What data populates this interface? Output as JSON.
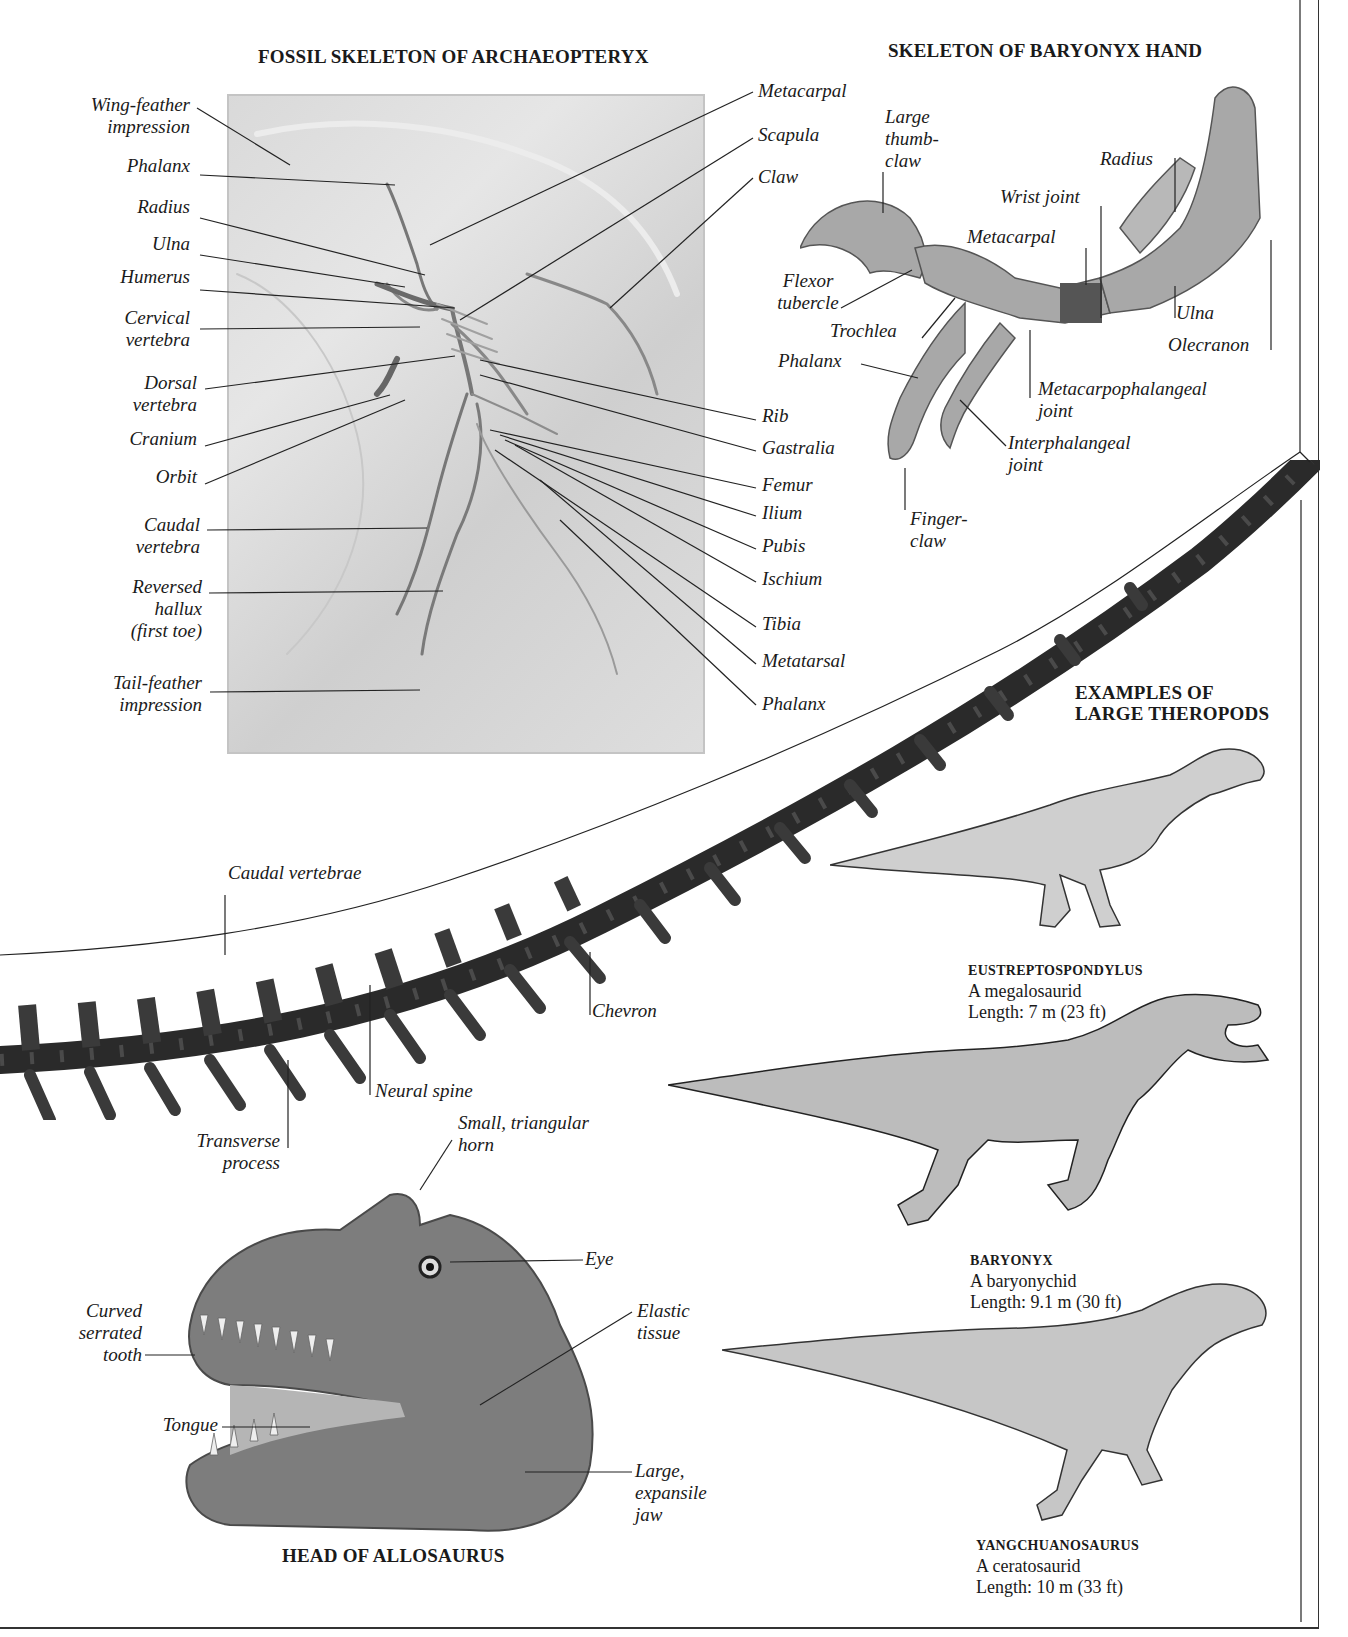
{
  "sections": {
    "archaeopteryx": {
      "title": "FOSSIL SKELETON OF ARCHAEOPTERYX",
      "labels_left": [
        "Wing-feather\nimpression",
        "Phalanx",
        "Radius",
        "Ulna",
        "Humerus",
        "Cervical\nvertebra",
        "Dorsal\nvertebra",
        "Cranium",
        "Orbit",
        "Caudal\nvertebra",
        "Reversed\nhallux\n(first toe)",
        "Tail-feather\nimpression"
      ],
      "labels_right": [
        "Metacarpal",
        "Scapula",
        "Claw",
        "Rib",
        "Gastralia",
        "Femur",
        "Ilium",
        "Pubis",
        "Ischium",
        "Tibia",
        "Metatarsal",
        "Phalanx"
      ]
    },
    "baryonyx_hand": {
      "title": "SKELETON OF BARYONYX HAND",
      "labels": {
        "large_thumb_claw": "Large\nthumb-\nclaw",
        "radius": "Radius",
        "wrist_joint": "Wrist joint",
        "metacarpal": "Metacarpal",
        "flexor_tubercle": "Flexor\ntubercle",
        "trochlea": "Trochlea",
        "ulna": "Ulna",
        "olecranon": "Olecranon",
        "phalanx": "Phalanx",
        "metacarpophalangeal_joint": "Metacarpophalangeal\njoint",
        "interphalangeal_joint": "Interphalangeal\njoint",
        "finger_claw": "Finger-\nclaw"
      }
    },
    "tail": {
      "labels": {
        "caudal_vertebrae": "Caudal vertebrae",
        "chevron": "Chevron",
        "neural_spine": "Neural spine",
        "transverse_process": "Transverse\nprocess"
      }
    },
    "allosaurus_head": {
      "title": "HEAD OF ALLOSAURUS",
      "labels": {
        "horn": "Small, triangular\nhorn",
        "eye": "Eye",
        "elastic_tissue": "Elastic\ntissue",
        "tooth": "Curved\nserrated\ntooth",
        "tongue": "Tongue",
        "jaw": "Large,\nexpansile\njaw"
      }
    },
    "theropods": {
      "title": "EXAMPLES OF\nLARGE THEROPODS",
      "examples": [
        {
          "name": "EUSTREPTOSPONDYLUS",
          "family": "A megalosaurid",
          "length": "Length: 7 m (23 ft)"
        },
        {
          "name": "BARYONYX",
          "family": "A baryonychid",
          "length": "Length: 9.1 m (30 ft)"
        },
        {
          "name": "YANGCHUANOSAURUS",
          "family": "A ceratosaurid",
          "length": "Length: 10 m (33 ft)"
        }
      ]
    }
  },
  "colors": {
    "ink": "#1a1a1a",
    "fossil_slab": "#dcdcdc",
    "bone_dark": "#2a2a2a",
    "bone_mid": "#8a8a8a",
    "leader_line": "#222222"
  }
}
